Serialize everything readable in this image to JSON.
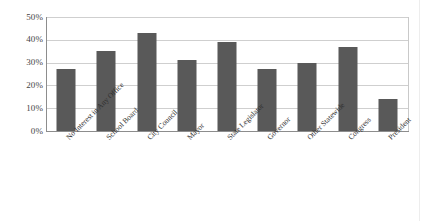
{
  "chart_data": {
    "type": "bar",
    "title": "",
    "subtitle": "",
    "xlabel": "",
    "ylabel": "",
    "ylim": [
      0,
      50
    ],
    "grid": true,
    "legend": false,
    "orientation": "vertical",
    "value_suffix": "%",
    "categories": [
      "No Interest in Any Office",
      "School Board",
      "City Council",
      "Mayor",
      "State Legislator",
      "Governor",
      "Other Statewide",
      "Congress",
      "President"
    ],
    "values": [
      27,
      35,
      43,
      31,
      39,
      27,
      30,
      37,
      14
    ],
    "y_ticks": [
      {
        "value": 50,
        "label": "50%"
      },
      {
        "value": 40,
        "label": "40%"
      },
      {
        "value": 30,
        "label": "30%"
      },
      {
        "value": 20,
        "label": "20%"
      },
      {
        "value": 10,
        "label": "10%"
      },
      {
        "value": 0,
        "label": "0%"
      }
    ],
    "colors": {
      "bar": "#595959",
      "gridline": "#cfcfcf",
      "axis": "#8d8d8d",
      "tick_text": "#454545",
      "category_text": "#2f2f2f",
      "background": "#ffffff"
    }
  },
  "caption": {
    "text": ""
  }
}
